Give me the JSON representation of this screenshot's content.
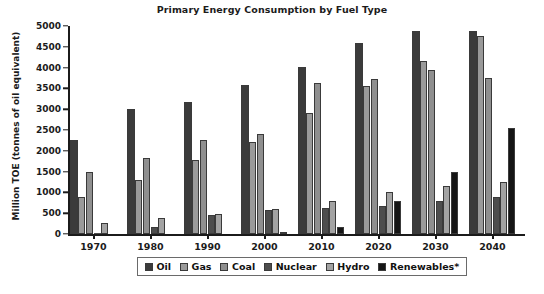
{
  "chart_data": {
    "type": "bar",
    "title": "Primary Energy Consumption by Fuel Type",
    "xlabel": "",
    "ylabel": "Million TOE (tonnes of oil equivalent)",
    "categories": [
      "1970",
      "1980",
      "1990",
      "2000",
      "2010",
      "2020",
      "2030",
      "2040"
    ],
    "ylim": [
      0,
      5000
    ],
    "yticks": [
      0,
      500,
      1000,
      1500,
      2000,
      2500,
      3000,
      3500,
      4000,
      4500,
      5000
    ],
    "ytick_labels": [
      "0",
      "500",
      "1000",
      "1500",
      "2000",
      "2500",
      "3000",
      "3500",
      "4000",
      "4500",
      "5000"
    ],
    "grid": false,
    "legend_position": "bottom",
    "series": [
      {
        "name": "Oil",
        "color": "#3b3b3b",
        "values": [
          2250,
          3000,
          3170,
          3580,
          4020,
          4600,
          4870,
          4870
        ]
      },
      {
        "name": "Gas",
        "color": "#9a9a9a",
        "values": [
          900,
          1290,
          1770,
          2200,
          2900,
          3550,
          4150,
          4750
        ]
      },
      {
        "name": "Coal",
        "color": "#8f8f8f",
        "values": [
          1480,
          1820,
          2250,
          2400,
          3620,
          3720,
          3950,
          3750
        ]
      },
      {
        "name": "Nuclear",
        "color": "#4d4d4d",
        "values": [
          20,
          170,
          450,
          580,
          630,
          680,
          800,
          900
        ]
      },
      {
        "name": "Hydro",
        "color": "#a3a3a3",
        "values": [
          270,
          390,
          490,
          600,
          800,
          1020,
          1150,
          1250
        ]
      },
      {
        "name": "Renewables*",
        "color": "#151515",
        "values": [
          0,
          0,
          10,
          50,
          180,
          800,
          1500,
          2550
        ]
      }
    ]
  }
}
